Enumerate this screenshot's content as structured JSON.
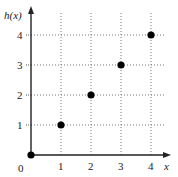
{
  "chart_data": {
    "type": "scatter",
    "title": "",
    "xlabel": "x",
    "ylabel": "h(x)",
    "x": [
      0,
      1,
      2,
      3,
      4
    ],
    "y": [
      0,
      1,
      2,
      3,
      4
    ],
    "series": [
      {
        "name": "h(x)",
        "points": [
          [
            0,
            0
          ],
          [
            1,
            1
          ],
          [
            2,
            2
          ],
          [
            3,
            3
          ],
          [
            4,
            4
          ]
        ],
        "color": "#000000",
        "marker": "filled-circle"
      }
    ],
    "xticks": [
      "0",
      "1",
      "2",
      "3",
      "4"
    ],
    "yticks": [
      "1",
      "2",
      "3",
      "4"
    ],
    "xlim": [
      0,
      4.6
    ],
    "ylim": [
      0,
      4.9
    ],
    "grid": {
      "on": true,
      "style": "dotted"
    },
    "legend": null
  },
  "axes": {
    "x_label": "x",
    "y_label": "h(x)",
    "origin_label": "0"
  },
  "colors": {
    "axis": "#222222",
    "grid": "#777777",
    "point": "#000000"
  }
}
